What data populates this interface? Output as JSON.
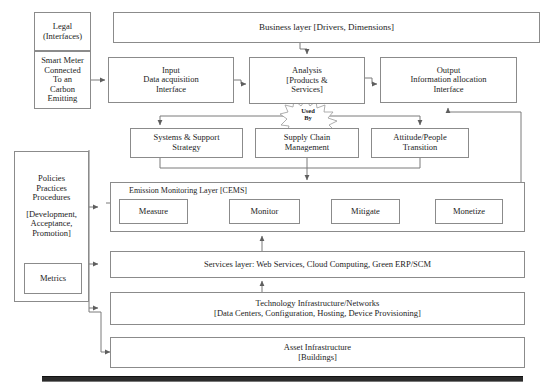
{
  "diagram": {
    "title_bar": {
      "business_layer": "Business layer [Drivers, Dimensions]"
    },
    "left_column": {
      "legal": "Legal\n(Interfaces)",
      "legal_l1": "Legal",
      "legal_l2": "(Interfaces)",
      "smart_meter_l1": "Smart Meter",
      "smart_meter_l2": "Connected",
      "smart_meter_l3": "To an",
      "smart_meter_l4": "Carbon",
      "smart_meter_l5": "Emitting",
      "policies_l1": "Policies",
      "policies_l2": "Practices",
      "policies_l3": "Procedures",
      "policies_l4": "[Development,",
      "policies_l5": "Acceptance,",
      "policies_l6": "Promotion]",
      "metrics": "Metrics"
    },
    "row_interfaces": [
      {
        "l1": "Input",
        "l2": "Data acquisition",
        "l3": "Interface"
      },
      {
        "l1": "Analysis",
        "l2": "[Products &",
        "l3": "Services]"
      },
      {
        "l1": "Output",
        "l2": "Information allocation",
        "l3": "Interface"
      }
    ],
    "row_strategy": [
      {
        "l1": "Systems & Support",
        "l2": "Strategy"
      },
      {
        "l1": "Supply Chain",
        "l2": "Management"
      },
      {
        "l1": "Attitude/People",
        "l2": "Transition"
      }
    ],
    "connector_label": {
      "l1": "Used",
      "l2": "By"
    },
    "cems": {
      "title": "Emission Monitoring Layer [CEMS]",
      "stages": [
        "Measure",
        "Monitor",
        "Mitigate",
        "Monetize"
      ]
    },
    "services_layer": "Services layer: Web Services,  Cloud Computing, Green ERP/SCM",
    "technology_layer": {
      "l1": "Technology Infrastructure/Networks",
      "l2": "[Data Centers, Configuration, Hosting, Device Provisioning]"
    },
    "asset_layer": {
      "l1": "Asset Infrastructure",
      "l2": "[Buildings]"
    },
    "colors": {
      "box_border": "#8b8b8b",
      "connector": "#6e6e6e",
      "text": "#1c1c1c",
      "base_rule": "#2b2b2b",
      "page_background": "#ffffff"
    }
  }
}
